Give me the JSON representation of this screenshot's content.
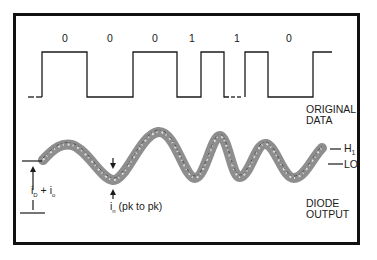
{
  "diagram": {
    "bits": [
      {
        "label": "0",
        "x": 62
      },
      {
        "label": "0",
        "x": 107
      },
      {
        "label": "0",
        "x": 152
      },
      {
        "label": "1",
        "x": 188
      },
      {
        "label": "1",
        "x": 233
      },
      {
        "label": "0",
        "x": 285
      }
    ],
    "labels": {
      "original_data_line1": "ORIGINAL",
      "original_data_line2": "DATA",
      "diode_output_line1": "DIODE",
      "diode_output_line2": "OUTPUT",
      "hi_level": "H",
      "hi_level_sub": "1",
      "lo_level": "LO",
      "id_plus_io_i1": "i",
      "id_plus_io_sub1": "D",
      "id_plus_io_op": " + i",
      "id_plus_io_sub2": "o",
      "noise_i": "i",
      "noise_sub": "n",
      "noise_desc": " (pk to pk)"
    },
    "colors": {
      "line": "#1a1a1a",
      "noise_band": "#7a7a7a",
      "frame": "#111111"
    }
  }
}
